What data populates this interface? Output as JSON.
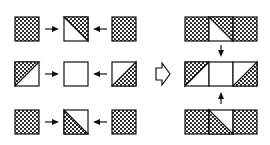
{
  "diagram": {
    "colors": {
      "stroke": "#111111",
      "fill": "#ffffff",
      "dot": "#111111"
    },
    "left_grid": {
      "rows": [
        {
          "tiles": [
            "full",
            "diag-tl-br-upper-right",
            "full"
          ]
        },
        {
          "tiles": [
            "diag-bl-tr-upper-left",
            "empty",
            "diag-bl-tr-lower-right"
          ]
        },
        {
          "tiles": [
            "full",
            "diag-tl-br-lower-left",
            "full"
          ]
        }
      ],
      "arrows": "outer tiles point toward center tile in each row"
    },
    "transition_arrow": "hollow-right-arrow",
    "right_result": {
      "rows": [
        {
          "tiles": [
            "full",
            "diag-tl-br-upper-right",
            "full"
          ]
        },
        {
          "tiles": [
            "diag-bl-tr-upper-left",
            "empty",
            "diag-bl-tr-lower-right"
          ]
        },
        {
          "tiles": [
            "full",
            "diag-tl-br-lower-left",
            "full"
          ]
        }
      ],
      "arrows": "top and bottom strips point toward middle strip"
    }
  }
}
